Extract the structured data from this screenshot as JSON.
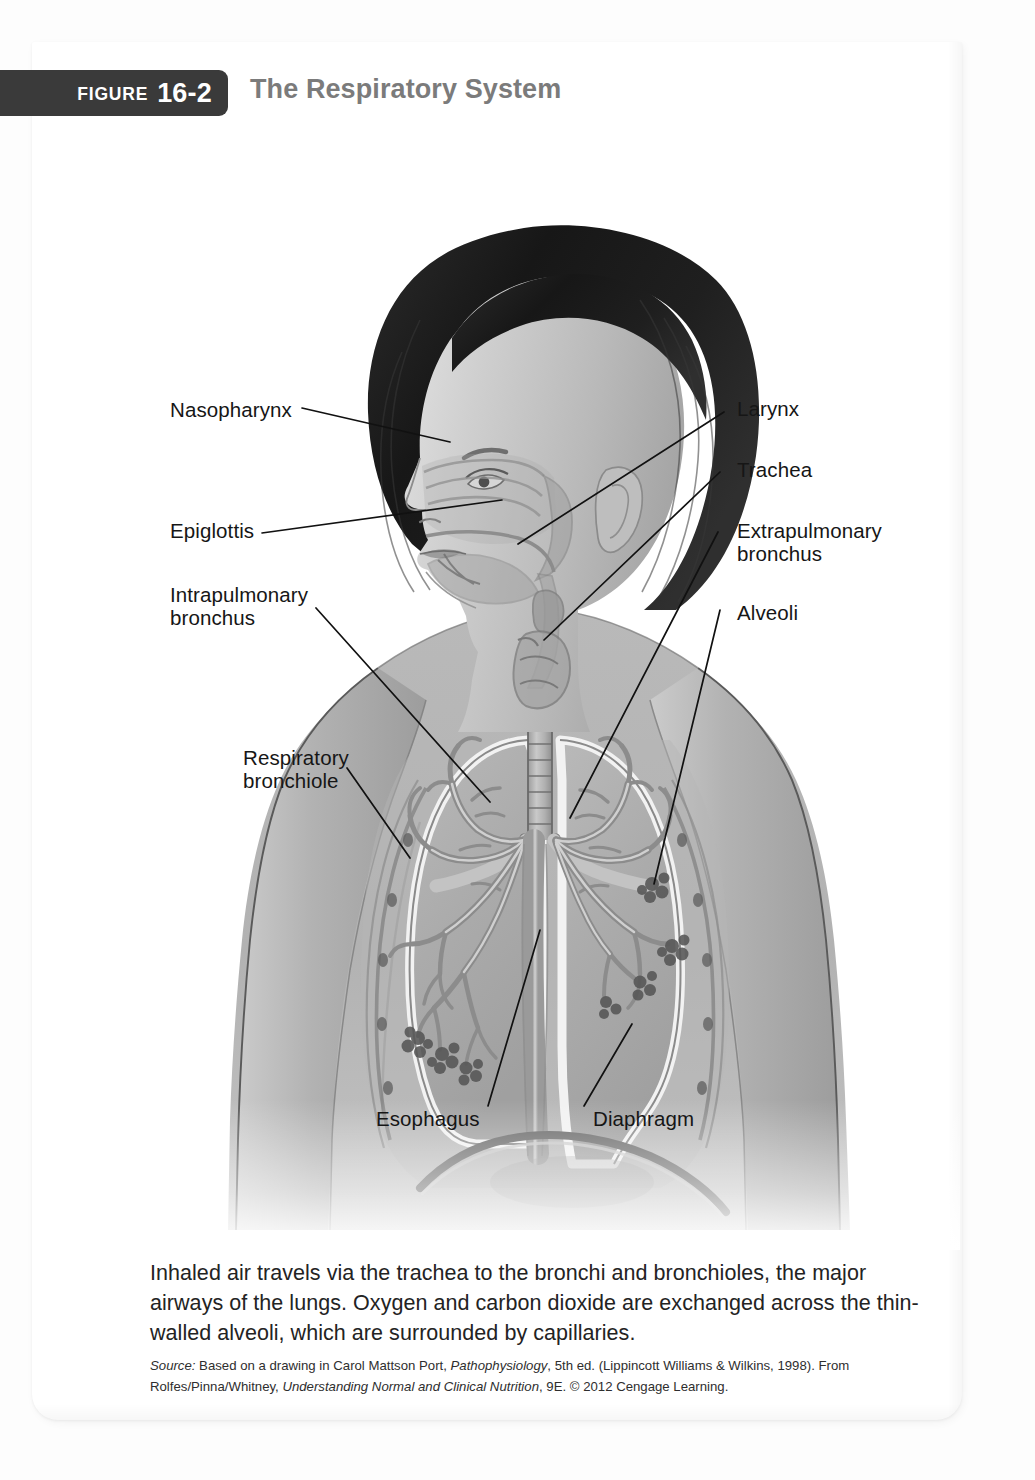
{
  "figure": {
    "tab_word": "FIGURE",
    "tab_number": "16-2",
    "title": "The Respiratory System"
  },
  "labels": [
    {
      "id": "nasopharynx",
      "text": "Nasopharynx"
    },
    {
      "id": "epiglottis",
      "text": "Epiglottis"
    },
    {
      "id": "intrapulmonary-l1",
      "text": "Intrapulmonary"
    },
    {
      "id": "intrapulmonary-l2",
      "text": "bronchus"
    },
    {
      "id": "respiratory-l1",
      "text": "Respiratory"
    },
    {
      "id": "respiratory-l2",
      "text": "bronchiole"
    },
    {
      "id": "larynx",
      "text": "Larynx"
    },
    {
      "id": "trachea",
      "text": "Trachea"
    },
    {
      "id": "extrapulmonary-l1",
      "text": "Extrapulmonary"
    },
    {
      "id": "extrapulmonary-l2",
      "text": "bronchus"
    },
    {
      "id": "alveoli",
      "text": "Alveoli"
    },
    {
      "id": "esophagus",
      "text": "Esophagus"
    },
    {
      "id": "diaphragm",
      "text": "Diaphragm"
    }
  ],
  "label_text": {
    "nasopharynx": "Nasopharynx",
    "epiglottis": "Epiglottis",
    "intrapulmonary_line1": "Intrapulmonary",
    "intrapulmonary_line2": "bronchus",
    "respiratory_line1": "Respiratory",
    "respiratory_line2": "bronchiole",
    "larynx": "Larynx",
    "trachea": "Trachea",
    "extrapulmonary_line1": "Extrapulmonary",
    "extrapulmonary_line2": "bronchus",
    "alveoli": "Alveoli",
    "esophagus": "Esophagus",
    "diaphragm": "Diaphragm"
  },
  "caption": {
    "body": "Inhaled air travels via the trachea to the bronchi and bronchioles, the major airways of the lungs. Oxygen and carbon dioxide are exchanged across the thin-walled alveoli, which are surrounded by capillaries.",
    "source_word": "Source:",
    "source_part1": " Based on a drawing in Carol Mattson Port, ",
    "source_italic1": "Pathophysiology",
    "source_part2": ", 5th ed. (Lippincott Williams & Wilkins, 1998). From Rolfes/Pinna/Whitney, ",
    "source_italic2": "Understanding Normal and Clinical Nutrition",
    "source_part3": ", 9E. © 2012 Cengage Learning."
  },
  "colors": {
    "tab_background": "#3a3a3a",
    "tab_text": "#ffffff",
    "title_text": "#7b7b7b",
    "label_text": "#161616",
    "caption_text": "#232323",
    "page_background": "#ffffff",
    "outer_background": "#fdfdfd",
    "skin_mid": "#b6b6b6",
    "hair_dark": "#1c1c1c",
    "lung_fill": "#aeaeae",
    "airway_light": "#e8e8e8",
    "leader_line": "#111111"
  },
  "illustration": {
    "subject": "female-upper-body-profile-anterior-torso",
    "parts": [
      "head-profile",
      "hair",
      "nasal-cavity",
      "oral-cavity",
      "pharynx",
      "larynx",
      "trachea",
      "left-lung",
      "right-lung",
      "bronchial-tree",
      "alveolar-clusters",
      "diaphragm",
      "esophagus",
      "rib-outline",
      "shoulders",
      "arms"
    ]
  }
}
